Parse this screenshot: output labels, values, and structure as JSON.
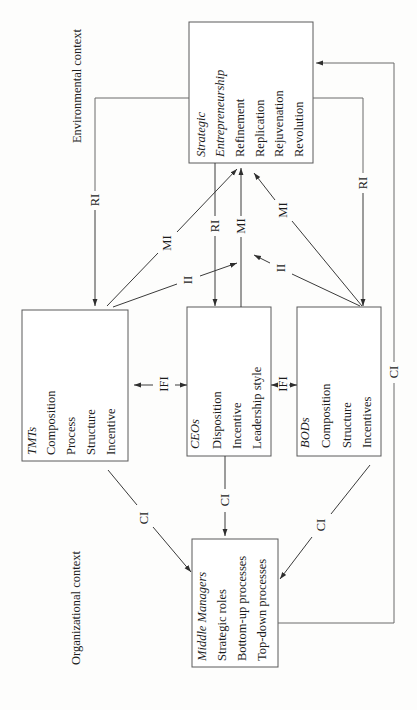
{
  "diagram": {
    "context_labels": {
      "environmental": "Environmental context",
      "organizational": "Organizational context"
    },
    "boxes": {
      "strategic_entrepreneurship": {
        "title": [
          "Strategic",
          "Entrepreneurship"
        ],
        "items": [
          "Refinement",
          "Replication",
          "Rejuvenation",
          "Revolution"
        ]
      },
      "tmts": {
        "title": "TMTs",
        "items": [
          "Composition",
          "Process",
          "Structure",
          "Incentive"
        ]
      },
      "ceos": {
        "title": "CEOs",
        "items": [
          "Disposition",
          "Incentive",
          "Leadership style"
        ]
      },
      "bods": {
        "title": "BODs",
        "items": [
          "Composition",
          "Structure",
          "Incentives"
        ]
      },
      "middle_managers": {
        "title": "Middle Managers",
        "items": [
          "Strategic roles",
          "Bottom-up processes",
          "Top-down processes"
        ]
      }
    },
    "links": [
      {
        "label": "RI",
        "from": "Strategic Entrepreneurship",
        "to": "TMTs"
      },
      {
        "label": "MI",
        "from": "TMTs",
        "to": "Strategic Entrepreneurship"
      },
      {
        "label": "II",
        "from": "TMTs",
        "to": "CEOs-Strategic Entrepreneurship link"
      },
      {
        "label": "RI",
        "from": "Strategic Entrepreneurship",
        "to": "CEOs"
      },
      {
        "label": "MI",
        "from": "CEOs",
        "to": "Strategic Entrepreneurship"
      },
      {
        "label": "MI",
        "from": "BODs",
        "to": "Strategic Entrepreneurship"
      },
      {
        "label": "II",
        "from": "BODs",
        "to": "CEOs-Strategic Entrepreneurship link"
      },
      {
        "label": "RI",
        "from": "Strategic Entrepreneurship",
        "to": "BODs"
      },
      {
        "label": "IFI",
        "from": "TMTs",
        "to": "CEOs",
        "bidirectional": true
      },
      {
        "label": "IFI",
        "from": "CEOs",
        "to": "BODs",
        "bidirectional": true
      },
      {
        "label": "CI",
        "from": "TMTs",
        "to": "Middle Managers"
      },
      {
        "label": "CI",
        "from": "CEOs",
        "to": "Middle Managers"
      },
      {
        "label": "CI",
        "from": "BODs",
        "to": "Middle Managers"
      },
      {
        "label": "CI",
        "from": "Middle Managers",
        "to": "Strategic Entrepreneurship"
      }
    ],
    "colors": {
      "line": "#3a3a3a",
      "box_border": "#5a5a5a",
      "text": "#1c1c1c",
      "background": "#fdfdfc"
    }
  }
}
